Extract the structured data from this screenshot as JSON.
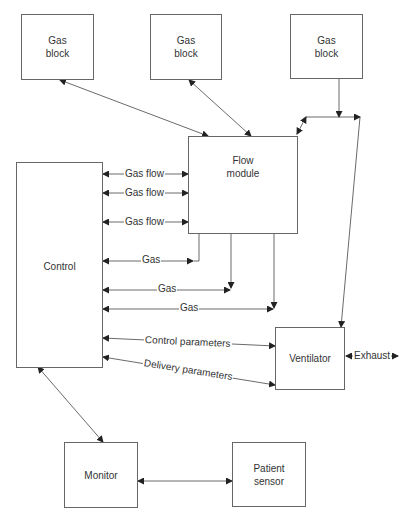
{
  "blocks": {
    "gas_block_1": "Gas\nblock",
    "gas_block_2": "Gas\nblock",
    "gas_block_3": "Gas\nblock",
    "flow_module": "Flow\nmodule",
    "control": "Control",
    "ventilator": "Ventilator",
    "monitor": "Monitor",
    "patient_sensor": "Patient\nsensor"
  },
  "connections": {
    "gas_flow_1": "Gas flow",
    "gas_flow_2": "Gas flow",
    "gas_flow_3": "Gas flow",
    "gas_1": "Gas",
    "gas_2": "Gas",
    "gas_3": "Gas",
    "control_parameters": "Control parameters",
    "delivery_parameters": "Delivery parameters",
    "exhaust": "Exhaust"
  },
  "colors": {
    "line": "#444444",
    "border": "#666666",
    "text": "#333333"
  }
}
